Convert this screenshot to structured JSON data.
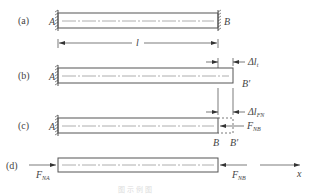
{
  "figure": {
    "panels": [
      {
        "id": "a",
        "label": "(a)",
        "left_label": "A",
        "right_label": "B",
        "dimension_label": "l"
      },
      {
        "id": "b",
        "label": "(b)",
        "left_label": "A",
        "right_label": "B′",
        "delta_label": "Δl",
        "delta_sub": "t"
      },
      {
        "id": "c",
        "label": "(c)",
        "left_label": "A",
        "bottom_left_label": "B",
        "bottom_right_label": "B′",
        "delta_label": "Δl",
        "delta_sub": "FN",
        "force_label": "F",
        "force_sub": "NB"
      },
      {
        "id": "d",
        "label": "(d)",
        "left_force_label": "F",
        "left_force_sub": "NA",
        "right_force_label": "F",
        "right_force_sub": "NB",
        "axis_label": "x"
      }
    ],
    "caption": "图 示 例 图"
  }
}
